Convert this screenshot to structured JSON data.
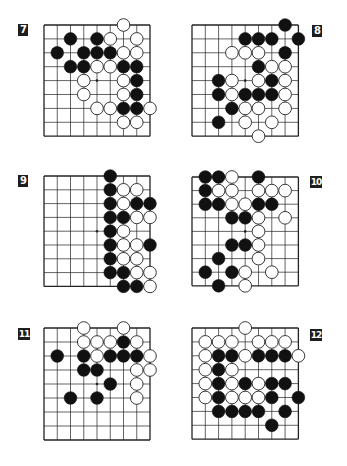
{
  "page": {
    "background": "#ffffff",
    "line_color": "#222222",
    "black_stone": "#111111",
    "white_stone": "#ffffff"
  },
  "problems": [
    {
      "label": "7",
      "board": {
        "x": 44,
        "y": 25,
        "cols": 9,
        "rows": 9,
        "dx": 13.25,
        "dy": 13.9
      },
      "label_pos": {
        "x": 18,
        "y": 24
      },
      "star": [
        4,
        4
      ],
      "black": [
        [
          2,
          1
        ],
        [
          4,
          1
        ],
        [
          1,
          2
        ],
        [
          3,
          2
        ],
        [
          4,
          2
        ],
        [
          5,
          2
        ],
        [
          2,
          3
        ],
        [
          3,
          3
        ],
        [
          6,
          3
        ],
        [
          7,
          3
        ],
        [
          7,
          4
        ],
        [
          7,
          5
        ],
        [
          6,
          6
        ],
        [
          7,
          6
        ]
      ],
      "white": [
        [
          6,
          0
        ],
        [
          5,
          1
        ],
        [
          7,
          1
        ],
        [
          6,
          2
        ],
        [
          7,
          2
        ],
        [
          4,
          3
        ],
        [
          5,
          3
        ],
        [
          3,
          4
        ],
        [
          6,
          4
        ],
        [
          3,
          5
        ],
        [
          6,
          5
        ],
        [
          4,
          6
        ],
        [
          5,
          6
        ],
        [
          8,
          6
        ],
        [
          6,
          7
        ],
        [
          7,
          7
        ]
      ]
    },
    {
      "label": "8",
      "board": {
        "x": 192,
        "y": 25,
        "cols": 9,
        "rows": 9,
        "dx": 13.3,
        "dy": 13.9
      },
      "label_pos": {
        "x": 312,
        "y": 25
      },
      "star": [
        4,
        4
      ],
      "black": [
        [
          7,
          0
        ],
        [
          4,
          1
        ],
        [
          5,
          1
        ],
        [
          6,
          1
        ],
        [
          8,
          1
        ],
        [
          7,
          2
        ],
        [
          5,
          3
        ],
        [
          2,
          4
        ],
        [
          6,
          4
        ],
        [
          2,
          5
        ],
        [
          4,
          5
        ],
        [
          5,
          5
        ],
        [
          6,
          5
        ],
        [
          3,
          6
        ],
        [
          2,
          7
        ]
      ],
      "white": [
        [
          3,
          2
        ],
        [
          4,
          2
        ],
        [
          5,
          2
        ],
        [
          6,
          3
        ],
        [
          7,
          3
        ],
        [
          3,
          4
        ],
        [
          5,
          4
        ],
        [
          7,
          4
        ],
        [
          3,
          5
        ],
        [
          7,
          5
        ],
        [
          4,
          6
        ],
        [
          5,
          6
        ],
        [
          7,
          6
        ],
        [
          4,
          7
        ],
        [
          6,
          7
        ],
        [
          5,
          8
        ]
      ]
    },
    {
      "label": "9",
      "board": {
        "x": 44,
        "y": 176,
        "cols": 9,
        "rows": 9,
        "dx": 13.25,
        "dy": 13.8
      },
      "label_pos": {
        "x": 18,
        "y": 175
      },
      "star": [
        4,
        4
      ],
      "black": [
        [
          5,
          0
        ],
        [
          5,
          1
        ],
        [
          5,
          2
        ],
        [
          7,
          2
        ],
        [
          8,
          2
        ],
        [
          5,
          3
        ],
        [
          6,
          3
        ],
        [
          5,
          4
        ],
        [
          5,
          5
        ],
        [
          8,
          5
        ],
        [
          5,
          6
        ],
        [
          5,
          7
        ],
        [
          6,
          7
        ],
        [
          6,
          8
        ],
        [
          7,
          8
        ]
      ],
      "white": [
        [
          6,
          1
        ],
        [
          7,
          1
        ],
        [
          6,
          2
        ],
        [
          7,
          3
        ],
        [
          8,
          3
        ],
        [
          6,
          4
        ],
        [
          6,
          5
        ],
        [
          7,
          5
        ],
        [
          6,
          6
        ],
        [
          7,
          6
        ],
        [
          7,
          7
        ],
        [
          8,
          7
        ],
        [
          8,
          8
        ]
      ]
    },
    {
      "label": "10",
      "board": {
        "x": 192,
        "y": 177,
        "cols": 9,
        "rows": 9,
        "dx": 13.3,
        "dy": 13.6
      },
      "label_pos": {
        "x": 310,
        "y": 176
      },
      "star": [
        4,
        4
      ],
      "black": [
        [
          1,
          0
        ],
        [
          2,
          0
        ],
        [
          5,
          0
        ],
        [
          1,
          1
        ],
        [
          1,
          2
        ],
        [
          2,
          2
        ],
        [
          5,
          2
        ],
        [
          6,
          2
        ],
        [
          3,
          3
        ],
        [
          4,
          3
        ],
        [
          3,
          5
        ],
        [
          4,
          5
        ],
        [
          2,
          6
        ],
        [
          1,
          7
        ],
        [
          3,
          7
        ],
        [
          2,
          8
        ]
      ],
      "white": [
        [
          3,
          0
        ],
        [
          2,
          1
        ],
        [
          3,
          1
        ],
        [
          5,
          1
        ],
        [
          6,
          1
        ],
        [
          7,
          1
        ],
        [
          3,
          2
        ],
        [
          4,
          2
        ],
        [
          5,
          3
        ],
        [
          7,
          3
        ],
        [
          5,
          4
        ],
        [
          5,
          5
        ],
        [
          5,
          6
        ],
        [
          4,
          7
        ],
        [
          6,
          7
        ],
        [
          4,
          8
        ]
      ]
    },
    {
      "label": "11",
      "board": {
        "x": 44,
        "y": 328,
        "cols": 9,
        "rows": 9,
        "dx": 13.25,
        "dy": 14.0
      },
      "label_pos": {
        "x": 18,
        "y": 328
      },
      "star": [
        4,
        4
      ],
      "black": [
        [
          6,
          1
        ],
        [
          1,
          2
        ],
        [
          3,
          2
        ],
        [
          5,
          2
        ],
        [
          6,
          2
        ],
        [
          7,
          2
        ],
        [
          3,
          3
        ],
        [
          4,
          3
        ],
        [
          5,
          4
        ],
        [
          2,
          5
        ],
        [
          4,
          5
        ]
      ],
      "white": [
        [
          3,
          0
        ],
        [
          6,
          0
        ],
        [
          3,
          1
        ],
        [
          4,
          1
        ],
        [
          5,
          1
        ],
        [
          7,
          1
        ],
        [
          4,
          2
        ],
        [
          8,
          2
        ],
        [
          7,
          3
        ],
        [
          8,
          3
        ],
        [
          7,
          4
        ],
        [
          7,
          5
        ]
      ]
    },
    {
      "label": "12",
      "board": {
        "x": 192,
        "y": 328,
        "cols": 9,
        "rows": 9,
        "dx": 13.3,
        "dy": 13.9
      },
      "label_pos": {
        "x": 310,
        "y": 329
      },
      "star": [
        4,
        4
      ],
      "black": [
        [
          2,
          2
        ],
        [
          3,
          2
        ],
        [
          5,
          2
        ],
        [
          6,
          2
        ],
        [
          7,
          2
        ],
        [
          2,
          3
        ],
        [
          2,
          4
        ],
        [
          4,
          4
        ],
        [
          6,
          4
        ],
        [
          7,
          4
        ],
        [
          2,
          5
        ],
        [
          6,
          5
        ],
        [
          8,
          5
        ],
        [
          2,
          6
        ],
        [
          3,
          6
        ],
        [
          4,
          6
        ],
        [
          5,
          6
        ],
        [
          7,
          6
        ],
        [
          6,
          7
        ]
      ],
      "white": [
        [
          4,
          0
        ],
        [
          1,
          1
        ],
        [
          2,
          1
        ],
        [
          3,
          1
        ],
        [
          5,
          1
        ],
        [
          6,
          1
        ],
        [
          7,
          1
        ],
        [
          1,
          2
        ],
        [
          4,
          2
        ],
        [
          8,
          2
        ],
        [
          1,
          3
        ],
        [
          3,
          3
        ],
        [
          1,
          4
        ],
        [
          3,
          4
        ],
        [
          5,
          4
        ],
        [
          1,
          5
        ],
        [
          3,
          5
        ],
        [
          4,
          5
        ],
        [
          5,
          5
        ]
      ]
    }
  ]
}
